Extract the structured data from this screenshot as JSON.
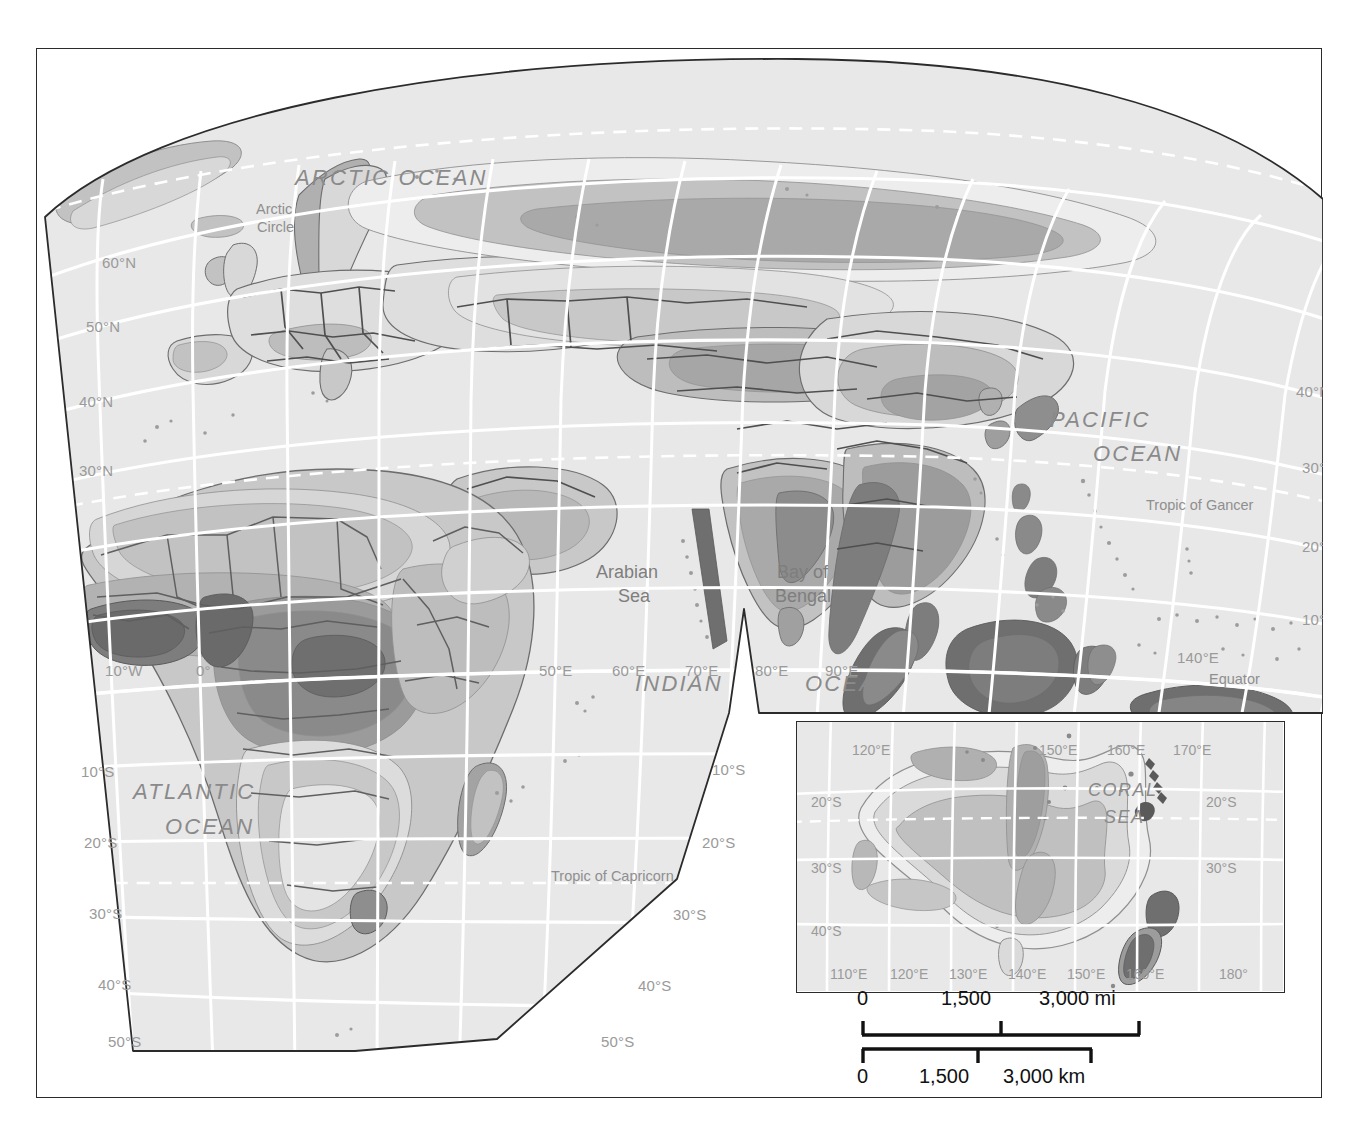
{
  "map": {
    "title_absent": true,
    "projection_note": "interrupted oval / Robinson-like eastern hemisphere",
    "ocean_labels": [
      {
        "id": "arctic-ocean",
        "text": "ARCTIC OCEAN",
        "x": 258,
        "y": 116,
        "size": "big"
      },
      {
        "id": "pacific-ocean-1",
        "text": "PACIFIC",
        "x": 1013,
        "y": 358,
        "size": "big"
      },
      {
        "id": "pacific-ocean-2",
        "text": "OCEAN",
        "x": 1056,
        "y": 392,
        "size": "big"
      },
      {
        "id": "atlantic-ocean-1",
        "text": "ATLANTIC",
        "x": 96,
        "y": 730,
        "size": "big"
      },
      {
        "id": "atlantic-ocean-2",
        "text": "OCEAN",
        "x": 128,
        "y": 765,
        "size": "big"
      },
      {
        "id": "indian-ocean-1",
        "text": "INDIAN",
        "x": 598,
        "y": 622,
        "size": "big"
      },
      {
        "id": "indian-ocean-2",
        "text": "OCEAN",
        "x": 768,
        "y": 622,
        "size": "big"
      }
    ],
    "sea_labels": [
      {
        "id": "arabian-sea-1",
        "text": "Arabian",
        "x": 559,
        "y": 513
      },
      {
        "id": "arabian-sea-2",
        "text": "Sea",
        "x": 581,
        "y": 537
      },
      {
        "id": "bay-of-bengal-1",
        "text": "Bay of",
        "x": 740,
        "y": 513
      },
      {
        "id": "bay-of-bengal-2",
        "text": "Bengal",
        "x": 738,
        "y": 537
      }
    ],
    "reference_lines": [
      {
        "id": "arctic-circle-1",
        "text": "Arctic",
        "x": 219,
        "y": 152
      },
      {
        "id": "arctic-circle-2",
        "text": "Circle",
        "x": 220,
        "y": 170
      },
      {
        "id": "tropic-of-cancer",
        "text": "Tropic of Gancer",
        "x": 1109,
        "y": 448
      },
      {
        "id": "tropic-of-capricorn",
        "text": "Tropic of Capricorn",
        "x": 514,
        "y": 819
      },
      {
        "id": "equator",
        "text": "Equator",
        "x": 1172,
        "y": 622
      }
    ],
    "latitude_labels": [
      {
        "text": "60°N",
        "x": 65,
        "y": 205
      },
      {
        "text": "50°N",
        "x": 49,
        "y": 269
      },
      {
        "text": "40°N",
        "x": 42,
        "y": 344
      },
      {
        "text": "30°N",
        "x": 42,
        "y": 413
      },
      {
        "text": "10°S",
        "x": 44,
        "y": 714
      },
      {
        "text": "20°S",
        "x": 47,
        "y": 785
      },
      {
        "text": "30°S",
        "x": 52,
        "y": 856
      },
      {
        "text": "40°S",
        "x": 61,
        "y": 927
      },
      {
        "text": "50°S",
        "x": 71,
        "y": 984
      },
      {
        "text": "40°N",
        "x": 1259,
        "y": 334
      },
      {
        "text": "30°N",
        "x": 1265,
        "y": 410
      },
      {
        "text": "20°N",
        "x": 1265,
        "y": 489
      },
      {
        "text": "10°N",
        "x": 1265,
        "y": 562
      },
      {
        "text": "0°",
        "x": 1294,
        "y": 626
      },
      {
        "text": "10°S",
        "x": 675,
        "y": 712
      },
      {
        "text": "20°S",
        "x": 665,
        "y": 785
      },
      {
        "text": "30°S",
        "x": 636,
        "y": 857
      },
      {
        "text": "40°S",
        "x": 601,
        "y": 928
      },
      {
        "text": "50°S",
        "x": 564,
        "y": 984
      }
    ],
    "longitude_labels": [
      {
        "text": "10°W",
        "x": 68,
        "y": 613
      },
      {
        "text": "0°",
        "x": 159,
        "y": 613
      },
      {
        "text": "50°E",
        "x": 502,
        "y": 613
      },
      {
        "text": "60°E",
        "x": 575,
        "y": 613
      },
      {
        "text": "70°E",
        "x": 648,
        "y": 613
      },
      {
        "text": "80°E",
        "x": 718,
        "y": 613
      },
      {
        "text": "90°E",
        "x": 788,
        "y": 613
      },
      {
        "text": "140°E",
        "x": 1140,
        "y": 600
      }
    ]
  },
  "inset": {
    "ocean_labels": [
      {
        "id": "coral-sea-1",
        "text": "CORAL",
        "x": 291,
        "y": 58
      },
      {
        "id": "coral-sea-2",
        "text": "SEA",
        "x": 307,
        "y": 85
      }
    ],
    "top_longitude_labels": [
      {
        "text": "120°E",
        "x": 55,
        "y": 20
      },
      {
        "text": "150°E",
        "x": 242,
        "y": 20
      },
      {
        "text": "160°E",
        "x": 310,
        "y": 20
      },
      {
        "text": "170°E",
        "x": 376,
        "y": 20
      }
    ],
    "bottom_longitude_labels": [
      {
        "text": "110°E",
        "x": 33,
        "y": 244
      },
      {
        "text": "120°E",
        "x": 93,
        "y": 244
      },
      {
        "text": "130°E",
        "x": 152,
        "y": 244
      },
      {
        "text": "140°E",
        "x": 211,
        "y": 244
      },
      {
        "text": "150°E",
        "x": 270,
        "y": 244
      },
      {
        "text": "160°E",
        "x": 329,
        "y": 244
      },
      {
        "text": "180°",
        "x": 422,
        "y": 244
      }
    ],
    "latitude_labels": [
      {
        "text": "20°S",
        "x": 14,
        "y": 72
      },
      {
        "text": "30°S",
        "x": 14,
        "y": 138
      },
      {
        "text": "40°S",
        "x": 14,
        "y": 201
      },
      {
        "text": "20°S",
        "x": 409,
        "y": 72
      },
      {
        "text": "30°S",
        "x": 409,
        "y": 138
      }
    ]
  },
  "scale": {
    "miles": {
      "labels": [
        "0",
        "1,500",
        "3,000 mi"
      ],
      "label_x": [
        0,
        107,
        200
      ],
      "bar_x0": 0,
      "bar_x1": 218,
      "tick_x": [
        0,
        109,
        218
      ],
      "unit": "mi"
    },
    "kilometers": {
      "labels": [
        "0",
        "1,500",
        "3,000 km"
      ],
      "label_x": [
        0,
        68,
        140
      ],
      "bar_x0": 0,
      "bar_x1": 178,
      "tick_x": [
        0,
        89,
        178
      ],
      "unit": "km"
    }
  },
  "colors": {
    "ocean_fill": "#e8e8e8",
    "land_lightest": "#ededed",
    "land_light": "#d8d8d8",
    "land_mid": "#c2c2c2",
    "land_dark": "#a0a0a0",
    "land_darkest": "#7d7d7d",
    "border_line": "#5a5a5a",
    "coast_line": "#8f8f8f",
    "graticule": "#ffffff",
    "frame": "#2b2b2b",
    "label_gray": "#8d8d8d",
    "scale_text": "#111111"
  }
}
